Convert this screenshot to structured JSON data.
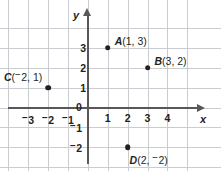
{
  "chart_data": {
    "type": "scatter",
    "title": "",
    "xlabel": "x",
    "ylabel": "y",
    "xlim": [
      -4,
      5
    ],
    "ylim": [
      -3,
      4
    ],
    "grid": true,
    "legend": false,
    "origin_label": "0",
    "x_ticks": [
      {
        "value": -3,
        "label": "3",
        "negative": true
      },
      {
        "value": -2,
        "label": "2",
        "negative": true
      },
      {
        "value": -1,
        "label": "1",
        "negative": true
      },
      {
        "value": 1,
        "label": "1",
        "negative": false
      },
      {
        "value": 2,
        "label": "2",
        "negative": false
      },
      {
        "value": 3,
        "label": "3",
        "negative": false
      },
      {
        "value": 4,
        "label": "4",
        "negative": false
      }
    ],
    "y_ticks": [
      {
        "value": 3,
        "label": "3",
        "negative": false
      },
      {
        "value": 2,
        "label": "2",
        "negative": false
      },
      {
        "value": 1,
        "label": "1",
        "negative": false
      },
      {
        "value": -1,
        "label": "1",
        "negative": true
      },
      {
        "value": -2,
        "label": "2",
        "negative": true
      }
    ],
    "points": [
      {
        "name": "A",
        "x": 1,
        "y": 3,
        "label_x": "1",
        "label_y": "3",
        "y_negative": false
      },
      {
        "name": "B",
        "x": 3,
        "y": 2,
        "label_x": "3",
        "label_y": "2",
        "y_negative": false
      },
      {
        "name": "C",
        "x": -2,
        "y": 1,
        "label_x": "2",
        "label_y": "1",
        "x_negative": true,
        "y_negative": false
      },
      {
        "name": "D",
        "x": 2,
        "y": -2,
        "label_x": "2",
        "label_y": "2",
        "y_negative": true
      }
    ]
  },
  "axes": {
    "x_name": "x",
    "y_name": "y"
  },
  "colors": {
    "grid": "#c9ccd1",
    "axis": "#58585b",
    "text": "#231f20",
    "point": "#231f20",
    "background": "#ffffff"
  }
}
